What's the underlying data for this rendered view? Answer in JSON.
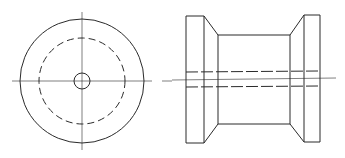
{
  "diagram": {
    "title": "Spool orthographic drawing",
    "line_color": "#2a2a2a",
    "background": "#ffffff",
    "views": [
      {
        "name": "End view",
        "type": "circular",
        "outer_circle": "solid",
        "inner_circle": "hidden (dashed)",
        "bore": "small circle at center",
        "centerlines": "horizontal and vertical"
      },
      {
        "name": "Side view",
        "type": "profile",
        "features": [
          "left flange",
          "left chamfer",
          "barrel",
          "right chamfer",
          "right flange"
        ],
        "hidden_lines": "bore shown as two dashed horizontal lines",
        "centerline": "horizontal"
      }
    ]
  }
}
